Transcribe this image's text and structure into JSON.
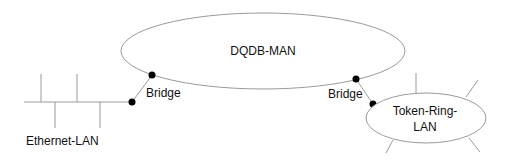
{
  "nodes": {
    "man": {
      "label": "DQDB-MAN"
    },
    "ethernet": {
      "label": "Ethernet-LAN"
    },
    "token_ring": {
      "label_line1": "Token-Ring-",
      "label_line2": "LAN"
    }
  },
  "bridges": [
    {
      "label": "Bridge",
      "connects": [
        "Ethernet-LAN",
        "DQDB-MAN"
      ]
    },
    {
      "label": "Bridge",
      "connects": [
        "DQDB-MAN",
        "Token-Ring-LAN"
      ]
    }
  ],
  "colors": {
    "line": "#9a9a9a",
    "dot": "#000000",
    "text": "#111111"
  }
}
